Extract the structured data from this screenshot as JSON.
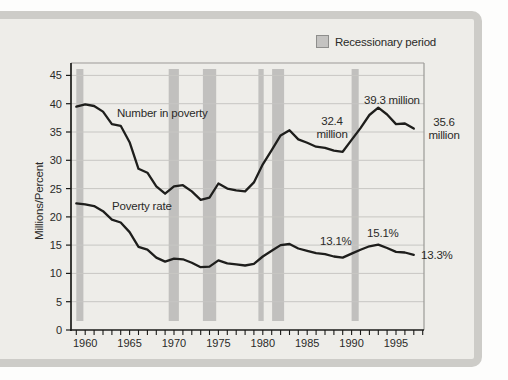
{
  "panel": {
    "background": "#eeede9",
    "border_color": "#cdccc8"
  },
  "legend": {
    "label": "Recessionary period",
    "swatch_color": "#c4c3c1"
  },
  "chart_data": {
    "type": "line",
    "title": "",
    "xlabel": "",
    "ylabel": "Millions/Percent",
    "xlim": [
      1958.4,
      1998.15
    ],
    "ylim": [
      0,
      47.2
    ],
    "grid": "horizontal",
    "legend_position": "top-right",
    "y_ticks": [
      0,
      5,
      10,
      15,
      20,
      25,
      30,
      35,
      40,
      45
    ],
    "x_tick_labels": [
      1960,
      1965,
      1970,
      1975,
      1980,
      1985,
      1990,
      1995
    ],
    "x_minor_tick_start": 1959,
    "x_minor_tick_end": 1998,
    "x": [
      1959,
      1960,
      1961,
      1962,
      1963,
      1964,
      1965,
      1966,
      1967,
      1968,
      1969,
      1970,
      1971,
      1972,
      1973,
      1974,
      1975,
      1976,
      1977,
      1978,
      1979,
      1980,
      1981,
      1982,
      1983,
      1984,
      1985,
      1986,
      1987,
      1988,
      1989,
      1990,
      1991,
      1992,
      1993,
      1994,
      1995,
      1996,
      1997
    ],
    "series": [
      {
        "name": "Number in poverty",
        "unit": "millions",
        "values": [
          39.5,
          39.9,
          39.6,
          38.6,
          36.4,
          36.1,
          33.2,
          28.5,
          27.8,
          25.4,
          24.1,
          25.4,
          25.6,
          24.5,
          23.0,
          23.4,
          25.9,
          25.0,
          24.7,
          24.5,
          26.1,
          29.3,
          31.8,
          34.4,
          35.3,
          33.7,
          33.1,
          32.4,
          32.2,
          31.7,
          31.5,
          33.6,
          35.7,
          38.0,
          39.3,
          38.1,
          36.4,
          36.5,
          35.6
        ]
      },
      {
        "name": "Poverty rate",
        "unit": "percent",
        "values": [
          22.4,
          22.2,
          21.9,
          21.0,
          19.5,
          19.0,
          17.3,
          14.7,
          14.2,
          12.8,
          12.1,
          12.6,
          12.5,
          11.9,
          11.1,
          11.2,
          12.3,
          11.8,
          11.6,
          11.4,
          11.7,
          13.0,
          14.0,
          15.0,
          15.2,
          14.4,
          14.0,
          13.6,
          13.4,
          13.0,
          12.8,
          13.5,
          14.2,
          14.8,
          15.1,
          14.5,
          13.8,
          13.7,
          13.3
        ]
      }
    ],
    "recession_bands": [
      [
        1959.0,
        1959.8
      ],
      [
        1969.4,
        1970.55
      ],
      [
        1973.25,
        1974.75
      ],
      [
        1979.5,
        1980.1
      ],
      [
        1981.05,
        1982.4
      ],
      [
        1990.0,
        1990.8
      ]
    ],
    "colors": {
      "line": "#1e1e1c",
      "axis": "#1a1a18",
      "grid": "#c7c6c3",
      "frame": "#9b9a97",
      "band": "#c1c0be",
      "tick_label": "#2a2a28"
    },
    "annotations": {
      "series_label_number": "Number in poverty",
      "series_label_rate": "Poverty rate",
      "num_mid_line1": "32.4",
      "num_mid_line2": "million",
      "num_peak": "39.3 million",
      "num_end_line1": "35.6",
      "num_end_line2": "million",
      "rate_mid": "13.1%",
      "rate_peak": "15.1%",
      "rate_end": "13.3%"
    }
  }
}
